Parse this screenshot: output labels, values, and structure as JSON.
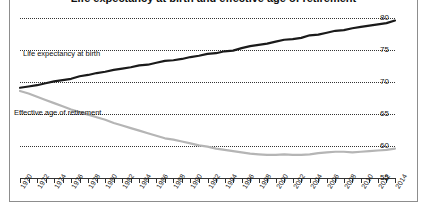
{
  "title": "Life expectancy at birth and effective age of retirement",
  "chart_data": {
    "type": "line",
    "title": "Life expectancy at birth and effective age of retirement",
    "xlabel": "",
    "ylabel": "",
    "ylim": [
      55,
      80
    ],
    "xlim": [
      1970,
      2014
    ],
    "y_ticks": [
      55,
      60,
      65,
      70,
      75,
      80
    ],
    "grid": true,
    "grid_style": "dotted-horizontal",
    "y_axis_position": "right",
    "legend": "inline-annotations",
    "x_tick_step": 2,
    "x_tick_labels": [
      "1970",
      "1972",
      "1974",
      "1976",
      "1978",
      "1980",
      "1982",
      "1984",
      "1986",
      "1988",
      "1990",
      "1992",
      "1994",
      "1996",
      "1998",
      "2000",
      "2002",
      "2004",
      "2006",
      "2008",
      "2010",
      "2012",
      "2014"
    ],
    "x": [
      1970,
      1971,
      1972,
      1973,
      1974,
      1975,
      1976,
      1977,
      1978,
      1979,
      1980,
      1981,
      1982,
      1983,
      1984,
      1985,
      1986,
      1987,
      1988,
      1989,
      1990,
      1991,
      1992,
      1993,
      1994,
      1995,
      1996,
      1997,
      1998,
      1999,
      2000,
      2001,
      2002,
      2003,
      2004,
      2005,
      2006,
      2007,
      2008,
      2009,
      2010,
      2011,
      2012,
      2013,
      2014
    ],
    "series": [
      {
        "name": "Life expectancy at birth",
        "color": "#1a1a1a",
        "values": [
          69.1,
          69.3,
          69.5,
          69.8,
          70.1,
          70.3,
          70.5,
          70.9,
          71.1,
          71.4,
          71.6,
          71.9,
          72.1,
          72.3,
          72.6,
          72.7,
          73.0,
          73.3,
          73.4,
          73.6,
          73.9,
          74.1,
          74.4,
          74.5,
          74.8,
          74.9,
          75.3,
          75.6,
          75.8,
          76.0,
          76.3,
          76.6,
          76.7,
          76.9,
          77.3,
          77.4,
          77.7,
          78.0,
          78.1,
          78.4,
          78.6,
          78.8,
          79.0,
          79.2,
          79.6
        ]
      },
      {
        "name": "Effective age of retirement",
        "color": "#b5b5b5",
        "values": [
          68.6,
          68.2,
          67.7,
          67.2,
          66.7,
          66.2,
          65.7,
          65.3,
          64.9,
          64.5,
          64.1,
          63.6,
          63.2,
          62.8,
          62.4,
          62.0,
          61.6,
          61.2,
          61.0,
          60.7,
          60.4,
          60.1,
          59.9,
          59.6,
          59.4,
          59.2,
          59.0,
          58.8,
          58.7,
          58.6,
          58.6,
          58.7,
          58.6,
          58.6,
          58.7,
          58.9,
          59.0,
          59.1,
          59.1,
          59.0,
          59.1,
          59.2,
          59.3,
          59.4,
          59.6
        ]
      }
    ],
    "annotations": [
      {
        "text": "Life expectancy at birth",
        "near_x": 1974,
        "near_y": 72.5
      },
      {
        "text": "Effective age of retirement",
        "near_x": 1972,
        "near_y": 63.0
      }
    ]
  }
}
